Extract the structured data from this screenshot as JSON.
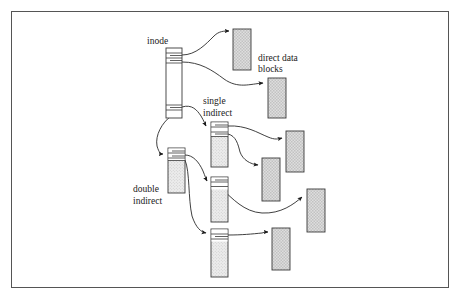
{
  "figure": {
    "type": "diagram",
    "frame": {
      "x": 11,
      "y": 11,
      "width": 438,
      "height": 277
    }
  },
  "labels": [
    {
      "name": "inode-label",
      "text": "inode",
      "x": 147,
      "y": 44,
      "anchor": "start"
    },
    {
      "name": "direct-data-blocks-label-line1",
      "text": "direct data",
      "x": 258,
      "y": 61,
      "anchor": "start"
    },
    {
      "name": "direct-data-blocks-label-line2",
      "text": "blocks",
      "x": 258,
      "y": 72,
      "anchor": "start"
    },
    {
      "name": "single-indirect-label-line1",
      "text": "single",
      "x": 203,
      "y": 104,
      "anchor": "start"
    },
    {
      "name": "single-indirect-label-line2",
      "text": "indirect",
      "x": 203,
      "y": 116,
      "anchor": "start"
    },
    {
      "name": "double-indirect-label-line1",
      "text": "double",
      "x": 133,
      "y": 192,
      "anchor": "start"
    },
    {
      "name": "double-indirect-label-line2",
      "text": "indirect",
      "x": 133,
      "y": 204,
      "anchor": "start"
    }
  ],
  "blocks": {
    "inode": {
      "name": "inode-block",
      "x": 166,
      "y": 48,
      "width": 16,
      "height": 70,
      "fill": "#ffffff",
      "dividers_y": [
        53,
        58,
        63,
        105,
        110
      ],
      "pointer_ticks": [
        {
          "y": 55,
          "x1": 170,
          "x2": 182
        },
        {
          "y": 61,
          "x1": 170,
          "x2": 182
        },
        {
          "y": 107,
          "x1": 170,
          "x2": 182
        }
      ]
    },
    "indirect_blocks": [
      {
        "name": "single-indirect-block",
        "x": 211,
        "y": 122,
        "width": 17,
        "height": 45,
        "fill": "#e8e8e8",
        "header_height": 14,
        "dividers_y": [
          127,
          132,
          136
        ]
      },
      {
        "name": "double-indirect-block",
        "x": 168,
        "y": 148,
        "width": 17,
        "height": 45,
        "fill": "#e0e0e0",
        "header_height": 12,
        "dividers_y": [
          153,
          158,
          160
        ]
      },
      {
        "name": "double-indirect-child-block-1",
        "x": 211,
        "y": 177,
        "width": 17,
        "height": 45,
        "fill": "#e8e8e8",
        "header_height": 12,
        "dividers_y": [
          182,
          186
        ]
      },
      {
        "name": "double-indirect-child-block-2",
        "x": 211,
        "y": 229,
        "width": 17,
        "height": 48,
        "fill": "#e8e8e8",
        "header_height": 12,
        "dividers_y": [
          234,
          239
        ]
      }
    ],
    "data_blocks": [
      {
        "name": "data-block-1",
        "x": 233,
        "y": 29,
        "width": 18,
        "height": 41,
        "fill": "#d9d9d9"
      },
      {
        "name": "data-block-2",
        "x": 268,
        "y": 78,
        "width": 18,
        "height": 40,
        "fill": "#d9d9d9"
      },
      {
        "name": "data-block-3",
        "x": 286,
        "y": 131,
        "width": 18,
        "height": 41,
        "fill": "#d9d9d9"
      },
      {
        "name": "data-block-4",
        "x": 262,
        "y": 158,
        "width": 18,
        "height": 43,
        "fill": "#d9d9d9"
      },
      {
        "name": "data-block-5",
        "x": 307,
        "y": 189,
        "width": 18,
        "height": 43,
        "fill": "#d9d9d9"
      },
      {
        "name": "data-block-6",
        "x": 272,
        "y": 228,
        "width": 18,
        "height": 42,
        "fill": "#d9d9d9"
      }
    ]
  },
  "links": [
    {
      "name": "link-inode-to-data-block-1",
      "d": "M 182,55 C 196,55 206,44 214,36 C 219,31 224,31 229,31"
    },
    {
      "name": "link-inode-to-data-block-2",
      "d": "M 182,62 C 200,62 212,70 224,79 C 238,89 250,84 263,83"
    },
    {
      "name": "link-inode-to-single-indirect",
      "d": "M 182,107 C 192,104 197,110 201,116 C 204,121 205,124 206,126"
    },
    {
      "name": "link-inode-to-double-indirect",
      "d": "M 171,116 C 162,123 155,135 157,146 C 159,153 161,154 163,154"
    },
    {
      "name": "link-single-indirect-to-data-block-3",
      "d": "M 228,126 C 246,125 258,133 268,137 C 275,140 278,139 282,138"
    },
    {
      "name": "link-single-indirect-to-data-block-4",
      "d": "M 228,134 C 236,136 238,144 240,152 C 243,160 250,164 258,165"
    },
    {
      "name": "link-double-indirect-to-child-1",
      "d": "M 185,155 C 193,155 199,162 203,171 C 205,176 206,179 207,181"
    },
    {
      "name": "link-double-indirect-to-child-2",
      "d": "M 185,160 C 190,172 188,198 192,216 C 196,228 201,232 206,233"
    },
    {
      "name": "link-child-1-to-data-block-5",
      "d": "M 222,189 C 232,198 244,212 262,213 C 281,214 294,204 302,197"
    },
    {
      "name": "link-child-2-to-data-block-6",
      "d": "M 228,235 C 242,235 252,234 262,233 C 265,232 266,232 268,232"
    }
  ],
  "colors": {
    "frame_stroke": "#555555",
    "block_stroke": "#3a3a3a",
    "link_stroke": "#2a2a2a",
    "text": "#1a1a1a",
    "data_block_fill": "#d9d9d9",
    "indirect_block_fill": "#e8e8e8",
    "inode_fill": "#ffffff",
    "background": "#ffffff"
  }
}
